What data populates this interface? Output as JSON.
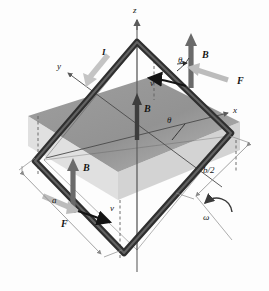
{
  "figure": {
    "background_color": "#fdfdfd",
    "colors": {
      "wire": "#3b3b3b",
      "wire_highlight": "#777777",
      "plane_fill": "#909090",
      "plane_fill_light": "#bdbdbd",
      "B_arrow": "#6a6a6a",
      "F_arrow": "#b9b9b9",
      "v_arrow": "#141414",
      "I_arrow": "#c0c0c0",
      "axis": "#5a5a5a",
      "dimension_line": "#8a8a8a",
      "text": "#151515"
    }
  },
  "axes": {
    "z_label": "z",
    "x_label": "x",
    "y_label": "y"
  },
  "vectors": {
    "B_top_right": "B",
    "B_center": "B",
    "B_lower_left": "B",
    "F_top_right": "F",
    "F_lower_left": "F",
    "v_top": "v",
    "v_bottom": "v",
    "current": "I",
    "omega": "ω"
  },
  "angles": {
    "theta_top": "θ",
    "theta_center": "θ"
  },
  "dimensions": {
    "side_a": "a",
    "half_b": "b/2"
  }
}
